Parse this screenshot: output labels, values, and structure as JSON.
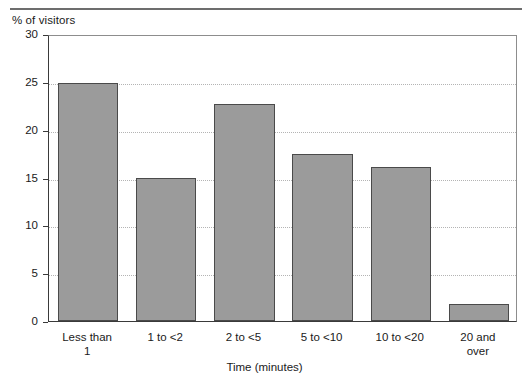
{
  "chart_data": {
    "type": "bar",
    "title": "",
    "xlabel": "Time (minutes)",
    "ylabel": "% of visitors",
    "categories": [
      "Less than 1",
      "1 to <2",
      "2 to <5",
      "5 to <10",
      "10 to <20",
      "20 and over"
    ],
    "category_lines": [
      [
        "Less than",
        "1"
      ],
      [
        "1 to <2"
      ],
      [
        "2 to <5"
      ],
      [
        "5 to <10"
      ],
      [
        "10 to <20"
      ],
      [
        "20 and",
        "over"
      ]
    ],
    "values": [
      24.9,
      14.9,
      22.7,
      17.5,
      16.1,
      1.8
    ],
    "ylim": [
      0,
      30
    ],
    "yticks": [
      0,
      5,
      10,
      15,
      20,
      25,
      30
    ],
    "ytick_labels": [
      "0",
      "5",
      "10",
      "15",
      "20",
      "25",
      "30"
    ],
    "grid": "horizontal-dotted",
    "legend": "none",
    "bar_color": "#9b9b9b",
    "bar_edge_color": "#4a4a4a",
    "grid_color": "#b4b4b4",
    "axis_color": "#3a3a3a"
  }
}
